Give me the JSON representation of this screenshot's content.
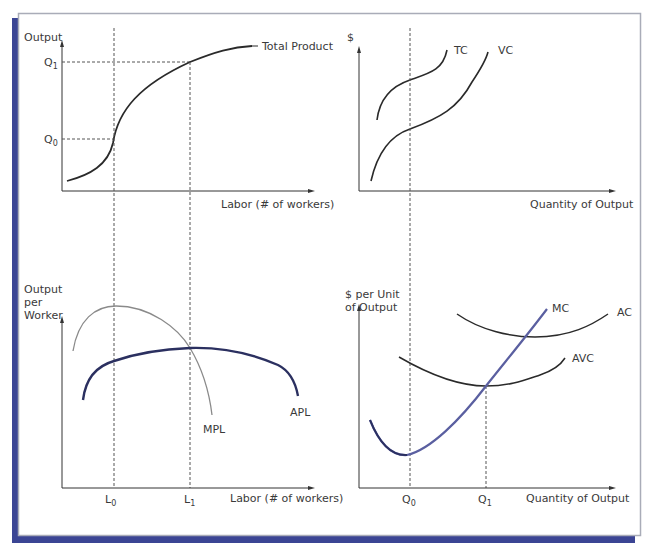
{
  "colors": {
    "frame_band": "#3b4594",
    "frame_border": "#a9acb8",
    "curve_dark": "#2a2a2a",
    "curve_gray": "#8a8a8a",
    "curve_navy": "#2b3060",
    "curve_mc": "#5a5fa0",
    "dashed": "#555555"
  },
  "panels": {
    "total_product": {
      "y_label": "Output",
      "x_label": "Labor (# of workers)",
      "curve_label": "Total Product",
      "q1": "Q",
      "q1_sub": "1",
      "q0": "Q",
      "q0_sub": "0"
    },
    "total_cost": {
      "y_label": "$",
      "x_label": "Quantity of Output",
      "tc_label": "TC",
      "vc_label": "VC"
    },
    "per_worker": {
      "y_label_line1": "Output",
      "y_label_line2": "per",
      "y_label_line3": "Worker",
      "x_label": "Labor (# of workers)",
      "mpl_label": "MPL",
      "apl_label": "APL",
      "l0": "L",
      "l0_sub": "0",
      "l1": "L",
      "l1_sub": "1"
    },
    "per_unit_cost": {
      "y_label_line1": "$ per Unit",
      "y_label_line2": "of Output",
      "x_label": "Quantity of Output",
      "mc_label": "MC",
      "ac_label": "AC",
      "avc_label": "AVC",
      "q0": "Q",
      "q0_sub": "0",
      "q1": "Q",
      "q1_sub": "1"
    }
  }
}
